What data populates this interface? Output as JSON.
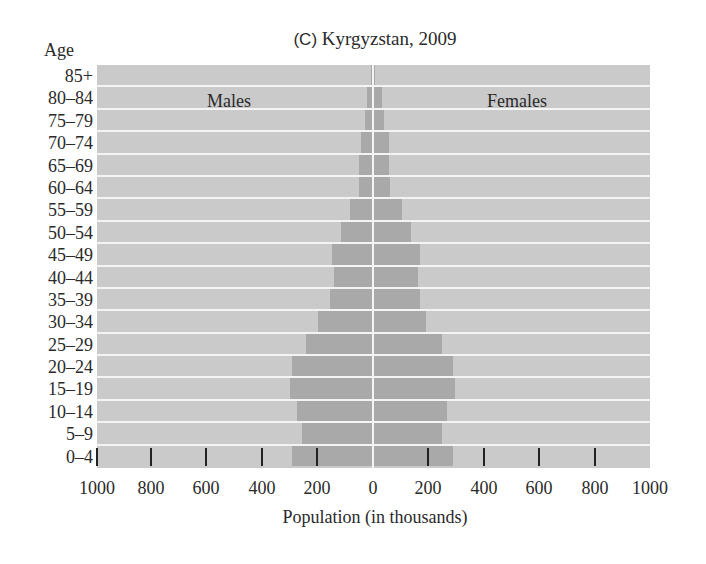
{
  "title_prefix": "(C)",
  "title_text": "Kyrgyzstan, 2009",
  "age_header": "Age",
  "males_label": "Males",
  "females_label": "Females",
  "xlabel": "Population (in thousands)",
  "colors": {
    "background": "#cacaca",
    "bar": "#a9a9a9",
    "separator": "#f4f4f4"
  },
  "chart_data": {
    "type": "bar",
    "orientation": "horizontal-population-pyramid",
    "title": "(C) Kyrgyzstan, 2009",
    "xlabel": "Population (in thousands)",
    "ylabel": "Age",
    "xlim": [
      -1000,
      1000
    ],
    "xticks": [
      1000,
      800,
      600,
      400,
      200,
      0,
      200,
      400,
      600,
      800,
      1000
    ],
    "grid": false,
    "annotations": [
      "Males",
      "Females"
    ],
    "categories": [
      "85+",
      "80–84",
      "75–79",
      "70–74",
      "65–69",
      "60–64",
      "55–59",
      "50–54",
      "45–49",
      "40–44",
      "35–39",
      "30–34",
      "25–29",
      "20–24",
      "15–19",
      "10–14",
      "5–9",
      "0–4"
    ],
    "series": [
      {
        "name": "Males",
        "values": [
          3,
          18,
          25,
          40,
          47,
          47,
          80,
          113,
          145,
          138,
          153,
          196,
          240,
          290,
          298,
          273,
          255,
          290
        ]
      },
      {
        "name": "Females",
        "values": [
          5,
          28,
          38,
          53,
          53,
          58,
          100,
          133,
          165,
          158,
          165,
          190,
          245,
          287,
          292,
          265,
          245,
          287
        ]
      }
    ]
  }
}
